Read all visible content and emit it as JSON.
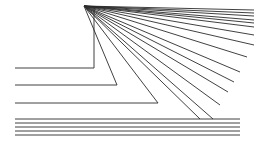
{
  "figure": {
    "canvas": {
      "width": 254,
      "height": 144,
      "background": "#ffffff"
    },
    "stroke_color": "#2b2b2b",
    "stroke_width": 0.9,
    "vertex": {
      "x": 84,
      "y": 6
    },
    "rays": [
      {
        "name": "ray-1",
        "points": "84,6 254,13"
      },
      {
        "name": "ray-2",
        "points": "84,6 254,20"
      },
      {
        "name": "ray-3",
        "points": "84,6 254,27"
      },
      {
        "name": "ray-4",
        "points": "84,6 254,45"
      },
      {
        "name": "ray-5",
        "points": "84,6 240,72"
      },
      {
        "name": "ray-6",
        "points": "84,6 228,92"
      },
      {
        "name": "ray-7",
        "points": "84,6 213,119"
      }
    ],
    "corners": [
      {
        "name": "corner-1",
        "points": "94,6 94,68 15,68",
        "vertex_x": 94,
        "vertex_y": 68,
        "left_x": 15
      },
      {
        "name": "corner-2",
        "points": "84,6 117,85 15,85",
        "vertex_x": 117,
        "vertex_y": 85,
        "left_x": 15
      },
      {
        "name": "corner-3",
        "points": "84,6 158,103 15,103",
        "vertex_x": 158,
        "vertex_y": 103,
        "left_x": 15
      }
    ],
    "bottom_lines": [
      {
        "name": "bottom-line-1",
        "y": 119,
        "x1": 15,
        "x2": 240
      },
      {
        "name": "bottom-line-2",
        "y": 123,
        "x1": 15,
        "x2": 240
      },
      {
        "name": "bottom-line-3",
        "y": 127,
        "x1": 15,
        "x2": 240
      },
      {
        "name": "bottom-line-4",
        "y": 131,
        "x1": 15,
        "x2": 240
      },
      {
        "name": "bottom-line-5",
        "y": 135,
        "x1": 15,
        "x2": 240
      }
    ],
    "fan_fill": [
      {
        "name": "fan-fill-1",
        "points": "84,6 254,10"
      },
      {
        "name": "fan-fill-2",
        "points": "84,6 254,16"
      },
      {
        "name": "fan-fill-3",
        "points": "84,6 254,23"
      },
      {
        "name": "fan-fill-4",
        "points": "84,6 254,35"
      },
      {
        "name": "fan-fill-5",
        "points": "84,6 247,57"
      },
      {
        "name": "fan-fill-6",
        "points": "84,6 234,82"
      },
      {
        "name": "fan-fill-7",
        "points": "84,6 220,105"
      },
      {
        "name": "fan-fill-8",
        "points": "84,6 200,119"
      }
    ]
  }
}
